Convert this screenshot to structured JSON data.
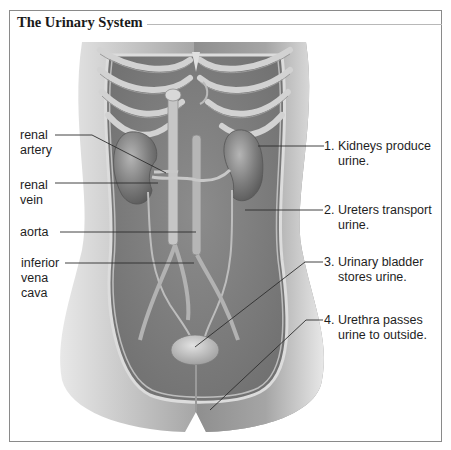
{
  "title": "The Urinary System",
  "colors": {
    "frame": "#8a8a8a",
    "leader_line": "#333333",
    "tissue": "#9a9a9a",
    "text": "#1e1e1e"
  },
  "left_labels": [
    {
      "id": "renal-artery",
      "line1": "renal",
      "line2": "artery"
    },
    {
      "id": "renal-vein",
      "line1": "renal",
      "line2": "vein"
    },
    {
      "id": "aorta",
      "line1": "aorta",
      "line2": ""
    },
    {
      "id": "inferior-vena-cava",
      "line1": "inferior",
      "line2": "vena",
      "line3": "cava"
    }
  ],
  "right_labels": [
    {
      "id": "kidneys",
      "line1": "1. Kidneys produce",
      "line2": "urine."
    },
    {
      "id": "ureters",
      "line1": "2. Ureters transport",
      "line2": "urine."
    },
    {
      "id": "bladder",
      "line1": "3. Urinary bladder",
      "line2": "stores urine."
    },
    {
      "id": "urethra",
      "line1": "4. Urethra passes",
      "line2": "urine to outside."
    }
  ]
}
